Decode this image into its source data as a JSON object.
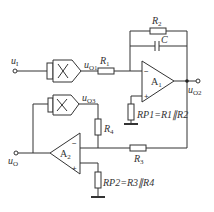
{
  "labels": {
    "ui": {
      "main": "u",
      "sub": "I"
    },
    "uo1": {
      "main": "u",
      "sub": "O1"
    },
    "uo2": {
      "main": "u",
      "sub": "O2"
    },
    "uo3": {
      "main": "u",
      "sub": "O3"
    },
    "uo": {
      "main": "u",
      "sub": "O"
    },
    "r1": {
      "main": "R",
      "sub": "1"
    },
    "r2": {
      "main": "R",
      "sub": "2"
    },
    "r3": {
      "main": "R",
      "sub": "3"
    },
    "r4": {
      "main": "R",
      "sub": "4"
    },
    "c": "C",
    "a1": {
      "main": "A",
      "sub": "1"
    },
    "a2": {
      "main": "A",
      "sub": "2"
    },
    "rp1": "RP1=R1∥R2",
    "rp2": "RP2=R3∥R4",
    "minus": "−",
    "plus": "+"
  },
  "colors": {
    "line": "#333333",
    "background": "#ffffff"
  }
}
